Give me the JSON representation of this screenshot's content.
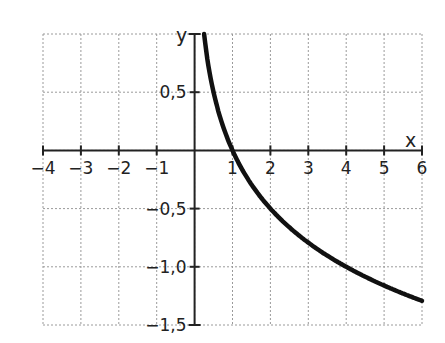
{
  "chart_data": {
    "type": "line",
    "title": "",
    "xlabel": "x",
    "ylabel": "y",
    "xlim": [
      -4,
      6
    ],
    "ylim": [
      -1.5,
      1.0
    ],
    "grid": true,
    "legend": null,
    "x_ticks": [
      -4,
      -3,
      -2,
      -1,
      1,
      2,
      3,
      4,
      5,
      6
    ],
    "x_tick_labels": [
      "−4",
      "−3",
      "−2",
      "−1",
      "1",
      "2",
      "3",
      "4",
      "5",
      "6"
    ],
    "y_ticks": [
      0.5,
      -0.5,
      -1.0,
      -1.5
    ],
    "y_tick_labels": [
      "0,5",
      "−0,5",
      "−1,0",
      "−1,5"
    ],
    "series": [
      {
        "name": "curve",
        "function": "y = -0.5 * log2(x)",
        "x": [
          0.25,
          0.5,
          1,
          2,
          3,
          4,
          5,
          6
        ],
        "y": [
          1.0,
          0.5,
          0.0,
          -0.5,
          -0.79,
          -1.0,
          -1.16,
          -1.29
        ]
      }
    ]
  },
  "axes": {
    "x_name": "x",
    "y_name": "y"
  }
}
